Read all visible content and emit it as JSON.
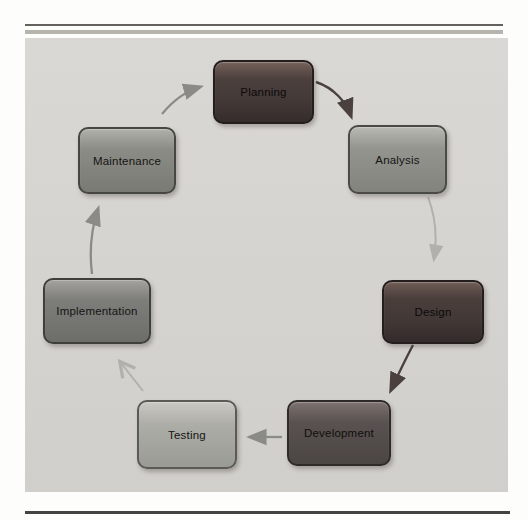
{
  "diagram": {
    "background_color": "#d5d3cf",
    "page_rule_colors": {
      "top_dark": "#63625f",
      "top_light": "#b7b4ae",
      "bottom_dark": "#44433f"
    },
    "nodes": [
      {
        "id": "planning",
        "label": "Planning",
        "color": "#453b39"
      },
      {
        "id": "analysis",
        "label": "Analysis",
        "color": "#8f908c"
      },
      {
        "id": "design",
        "label": "Design",
        "color": "#443a38"
      },
      {
        "id": "development",
        "label": "Development",
        "color": "#575150"
      },
      {
        "id": "testing",
        "label": "Testing",
        "color": "#abaaa6"
      },
      {
        "id": "implementation",
        "label": "Implementation",
        "color": "#7b7b78"
      },
      {
        "id": "maintenance",
        "label": "Maintenance",
        "color": "#8b8b87"
      }
    ],
    "edges": [
      {
        "from": "planning",
        "to": "analysis",
        "color": "#4a403e",
        "style": "curved, solid head"
      },
      {
        "from": "analysis",
        "to": "design",
        "color": "#b2b0ab",
        "style": "curved, solid head"
      },
      {
        "from": "design",
        "to": "development",
        "color": "#4a403e",
        "style": "curved, solid head"
      },
      {
        "from": "development",
        "to": "testing",
        "color": "#8a8a86",
        "style": "straight, solid head"
      },
      {
        "from": "testing",
        "to": "implementation",
        "color": "#b2b0ab",
        "style": "straight, open head"
      },
      {
        "from": "implementation",
        "to": "maintenance",
        "color": "#8a8a86",
        "style": "curved, solid head"
      },
      {
        "from": "maintenance",
        "to": "planning",
        "color": "#8a8a86",
        "style": "curved, solid head"
      }
    ]
  }
}
